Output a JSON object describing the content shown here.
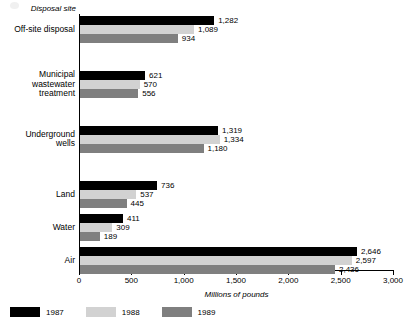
{
  "chart_data": {
    "type": "bar",
    "orientation": "horizontal",
    "title": "",
    "ylabel": "Disposal site",
    "xlabel": "Millions of pounds",
    "xlim": [
      0,
      3000
    ],
    "xticks": [
      "0",
      "500",
      "1,000",
      "1,500",
      "2,000",
      "2,500",
      "3,000"
    ],
    "xtick_values": [
      0,
      500,
      1000,
      1500,
      2000,
      2500,
      3000
    ],
    "grid": false,
    "legend_position": "bottom-left",
    "categories": [
      "Off-site disposal",
      "Municipal\nwastewater\ntreatment",
      "Underground\nwells",
      "Land",
      "Water",
      "Air"
    ],
    "series": [
      {
        "name": "1987",
        "color": "#000000",
        "values": [
          1282,
          621,
          1319,
          736,
          411,
          2646
        ],
        "labels": [
          "1,282",
          "621",
          "1,319",
          "736",
          "411",
          "2,646"
        ]
      },
      {
        "name": "1988",
        "color": "#d2d2d2",
        "values": [
          1089,
          570,
          1334,
          537,
          309,
          2597
        ],
        "labels": [
          "1,089",
          "570",
          "1,334",
          "537",
          "309",
          "2,597"
        ]
      },
      {
        "name": "1989",
        "color": "#7f7f7f",
        "values": [
          934,
          556,
          1180,
          445,
          189,
          2436
        ],
        "labels": [
          "934",
          "556",
          "1,180",
          "445",
          "189",
          "2,436"
        ]
      }
    ]
  }
}
